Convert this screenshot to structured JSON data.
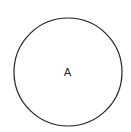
{
  "diagram": {
    "shapes": [
      {
        "type": "circle",
        "label": "A",
        "cx": 68,
        "cy": 72,
        "r": 54,
        "stroke": "#222222",
        "fill": "#ffffff"
      }
    ]
  }
}
